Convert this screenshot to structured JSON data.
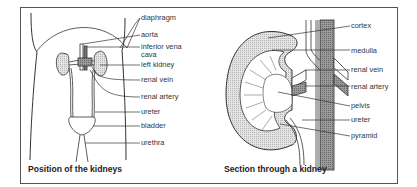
{
  "figures": [
    {
      "caption": "Position of the kidneys",
      "labels": [
        "diaphragm",
        "aorta",
        "inferior vena",
        "cava",
        "left kidney",
        "renal vein",
        "renal artery",
        "ureter",
        "bladder",
        "urethra"
      ]
    },
    {
      "caption": "Section through a kidney",
      "labels": [
        "cortex",
        "medulla",
        "renal vein",
        "renal artery",
        "pelvis",
        "ureter",
        "pyramid"
      ]
    }
  ],
  "colors": {
    "line": "#333333",
    "fill_light": "#d9d9d9",
    "fill_dark": "#8a8a8a",
    "border": "#555555"
  }
}
